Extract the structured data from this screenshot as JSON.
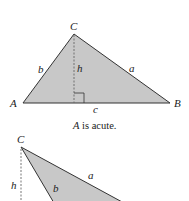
{
  "diagram": {
    "top_triangle": {
      "vertices": {
        "A": "A",
        "B": "B",
        "C": "C"
      },
      "sides": {
        "a": "a",
        "b": "b",
        "c": "c"
      },
      "height_label": "h",
      "caption_var": "A",
      "caption_text": " is acute."
    },
    "bottom_triangle": {
      "vertices": {
        "C": "C"
      },
      "sides": {
        "a": "a",
        "b": "b"
      },
      "height_label": "h"
    },
    "colors": {
      "fill": "#c8c8c8",
      "stroke": "#333333",
      "dash": "#666666"
    }
  }
}
